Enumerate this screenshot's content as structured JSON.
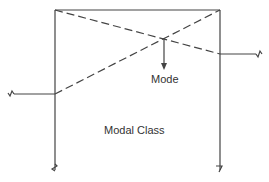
{
  "diagram": {
    "labels": {
      "mode": "Mode",
      "modal_class": "Modal Class"
    },
    "colors": {
      "stroke": "#444444",
      "text": "#333333",
      "background": "#ffffff"
    }
  }
}
